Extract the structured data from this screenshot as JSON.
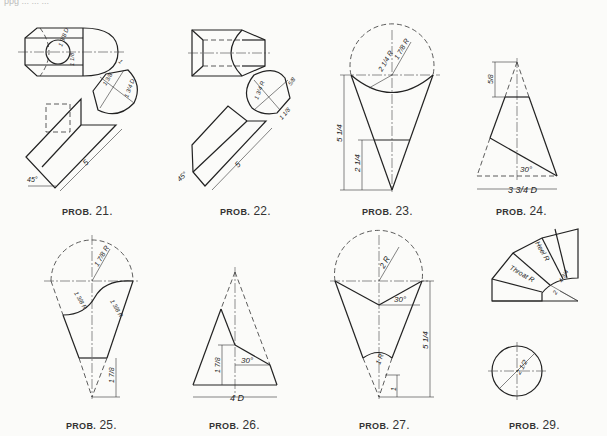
{
  "page": {
    "top_text_cropped": "ppg ... ... ..."
  },
  "problems": [
    {
      "id": "21",
      "caption_prefix": "PROB.",
      "caption_number": "21.",
      "dimensions": {
        "d1": "1 3/8 D",
        "d2": "1 1/8",
        "d3": "1",
        "d4": "1 3/8",
        "d5": "1 3/4 D",
        "angle": "45°",
        "length": "5"
      }
    },
    {
      "id": "22",
      "caption_prefix": "PROB.",
      "caption_number": "22.",
      "dimensions": {
        "d1": "1 3/4 R",
        "d2": "5/8",
        "d3": "1 1/8",
        "angle": "45°",
        "length": "5"
      }
    },
    {
      "id": "23",
      "caption_prefix": "PROB.",
      "caption_number": "23.",
      "dimensions": {
        "r1": "2 1/4 R",
        "r2": "1 7/8 R",
        "h1": "5 1/4",
        "h2": "2 1/4"
      }
    },
    {
      "id": "24",
      "caption_prefix": "PROB.",
      "caption_number": "24.",
      "dimensions": {
        "h1": "5/8",
        "angle": "30°",
        "base": "3 3/4 D"
      }
    },
    {
      "id": "25",
      "caption_prefix": "PROB.",
      "caption_number": "25.",
      "dimensions": {
        "r1": "1 7/8 R",
        "r2": "1 3/8 R",
        "r3": "1 3/8 R",
        "h1": "1 7/8"
      }
    },
    {
      "id": "26",
      "caption_prefix": "PROB.",
      "caption_number": "26.",
      "dimensions": {
        "h1": "1 7/8",
        "angle": "30°",
        "base": "4 D"
      }
    },
    {
      "id": "27",
      "caption_prefix": "PROB.",
      "caption_number": "27.",
      "dimensions": {
        "r1": "2 R",
        "angle": "30°",
        "r2": "1 R",
        "h1": "5 1/4",
        "h2": "1"
      }
    },
    {
      "id": "29",
      "caption_prefix": "PROB.",
      "caption_number": "29.",
      "dimensions": {
        "heel": "Heel R",
        "throat": "Throat R",
        "r1": "4 3/4",
        "r2": "2",
        "d1": "2 1/2"
      }
    }
  ]
}
